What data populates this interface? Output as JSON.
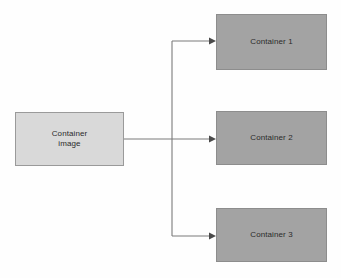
{
  "diagram": {
    "background_color": "#fefefe",
    "source_fill": "#d9d9d9",
    "target_fill": "#a3a3a3",
    "edge_color": "#7a7a7a",
    "text_color": "#2b2b2b"
  },
  "nodes": {
    "source": {
      "label": "Container\nimage",
      "x": 15,
      "y": 112,
      "width": 109,
      "height": 54
    },
    "targets": [
      {
        "label": "Container 1",
        "x": 216,
        "y": 14,
        "width": 111,
        "height": 56
      },
      {
        "label": "Container 2",
        "x": 216,
        "y": 111,
        "width": 111,
        "height": 54
      },
      {
        "label": "Container 3",
        "x": 216,
        "y": 208,
        "width": 111,
        "height": 54
      }
    ]
  },
  "edges": {
    "trunk_x": 172,
    "source_exit_x": 124,
    "source_exit_y": 139,
    "target_entry_x": 216,
    "branch_y": [
      41,
      139,
      236
    ],
    "arrow_count": 3
  }
}
